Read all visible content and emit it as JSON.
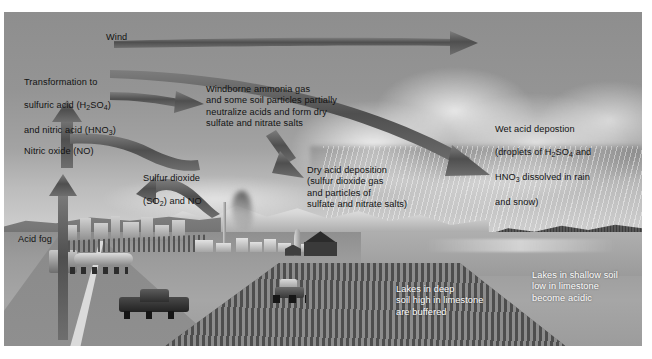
{
  "figure": {
    "background_color": "#9a9a9a",
    "ink_color": "#121212",
    "arrow_color": "#5a5a5a"
  },
  "labels": {
    "wind": "Wind",
    "transformation": "Transformation to\nsulfuric acid (H2SO4)\nand nitric acid (HNO3)",
    "transformation_line1": "Transformation to",
    "transformation_line2_a": "sulfuric acid (H",
    "transformation_line2_sub": "2",
    "transformation_line2_b": "SO",
    "transformation_line2_sub2": "4",
    "transformation_line2_c": ")",
    "transformation_line3_a": "and nitric acid (HNO",
    "transformation_line3_sub": "3",
    "transformation_line3_b": ")",
    "nitric_oxide": "Nitric oxide (NO)",
    "acid_fog": "Acid fog",
    "sulfur_dioxide_line1": "Sulfur dioxide",
    "sulfur_dioxide_line2_a": "(SO",
    "sulfur_dioxide_sub": "2",
    "sulfur_dioxide_line2_b": ") and NO",
    "windborne": "Windborne ammonia gas\nand some soil particles partially\nneutralize acids and form dry\nsulfate and nitrate salts",
    "dry_deposition": "Dry acid deposition\n(sulfur dioxide gas\nand particles of\nsulfate and nitrate salts)",
    "wet_deposition_line1": "Wet acid depostion",
    "wet_deposition_line2_a": "(droplets of H",
    "wet_deposition_sub1": "2",
    "wet_deposition_line2_b": "SO",
    "wet_deposition_sub2": "4",
    "wet_deposition_line2_c": " and",
    "wet_deposition_line3_a": "HNO",
    "wet_deposition_sub3": "3",
    "wet_deposition_line3_b": " dissolved in rain",
    "wet_deposition_line4": "and snow)",
    "lakes_deep": "Lakes in deep\nsoil high in limestone\nare buffered",
    "lakes_shallow": "Lakes in shallow soil\nlow in limestone\nbecome acidic"
  },
  "scene": {
    "sky": "hazy-grey-sky",
    "clouds": "cumulus-cloud-mass",
    "rain": "rain-streaks",
    "mountains": "snow-capped-mountain-range",
    "lake": "lake",
    "forest": "conifer-forest",
    "road": "highway",
    "vehicles": [
      "tanker-truck",
      "pickup-truck"
    ],
    "city": "city-skyline",
    "factory": "industrial-plant-with-smokestack",
    "smoke": "smoke-plume",
    "farm": "barn-and-silo",
    "field": "plowed-field",
    "tractor": "tractor"
  },
  "arrows": [
    {
      "name": "wind-arrow",
      "from": "left",
      "to": "right",
      "label": "Wind"
    },
    {
      "name": "transport-arrow",
      "from": "transformation",
      "to": "wet-acid-deposition"
    },
    {
      "name": "windborne-arrow",
      "from": "left",
      "to": "windborne-ammonia-text"
    },
    {
      "name": "nitric-oxide-up-arrow",
      "from": "road",
      "to": "nitric-oxide"
    },
    {
      "name": "transformation-up-arrow",
      "from": "nitric-oxide",
      "to": "transformation"
    },
    {
      "name": "s-curve-arrow",
      "from": "sulfur-dioxide",
      "to": "transformation"
    },
    {
      "name": "sulfur-dioxide-arrow",
      "from": "factory",
      "to": "sulfur-dioxide-text"
    },
    {
      "name": "dry-deposition-arrow",
      "from": "windborne-text",
      "to": "dry-acid-deposition"
    }
  ]
}
